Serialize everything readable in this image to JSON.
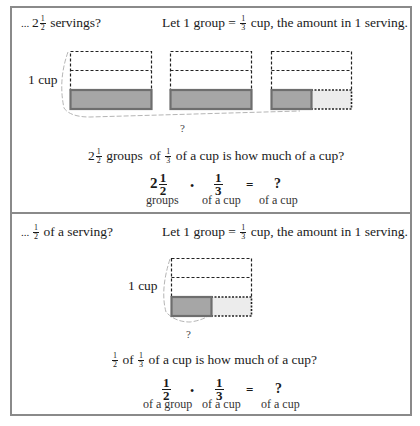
{
  "panel_top": {
    "heading": {
      "prefix": "... ",
      "whole": "2",
      "num": "1",
      "den": "2",
      "suffix": " servings?"
    },
    "definition": {
      "pre": "Let 1 group = ",
      "num": "1",
      "den": "3",
      "post": " cup, the amount in 1 serving."
    },
    "cup_label": "1 cup",
    "brace_label": "?",
    "question": {
      "whole": "2",
      "num": "1",
      "den": "2",
      "mid": " groups  of ",
      "num2": "1",
      "den2": "3",
      "post": " of a cup is how much of a cup?"
    },
    "equation": {
      "term1": {
        "whole": "2",
        "num": "1",
        "den": "2",
        "label": "groups"
      },
      "operator": "•",
      "term2": {
        "num": "1",
        "den": "3",
        "label": "of a cup"
      },
      "equals": "=",
      "result": {
        "value": "?",
        "label": "of a cup"
      }
    },
    "groups": [
      {
        "shaded_fraction": 1
      },
      {
        "shaded_fraction": 1
      },
      {
        "shaded_fraction": 0.5
      }
    ]
  },
  "panel_bottom": {
    "heading": {
      "prefix": "... ",
      "num": "1",
      "den": "2",
      "suffix": " of a serving?"
    },
    "definition": {
      "pre": "Let 1 group = ",
      "num": "1",
      "den": "3",
      "post": " cup, the amount in 1 serving."
    },
    "cup_label": "1 cup",
    "brace_label": "?",
    "question": {
      "num": "1",
      "den": "2",
      "mid": " of ",
      "num2": "1",
      "den2": "3",
      "post": " of a cup is how much of a cup?"
    },
    "equation": {
      "term1": {
        "num": "1",
        "den": "2",
        "label": "of a group"
      },
      "operator": "•",
      "term2": {
        "num": "1",
        "den": "3",
        "label": "of a cup"
      },
      "equals": "=",
      "result": {
        "value": "?",
        "label": "of a cup"
      }
    },
    "groups": [
      {
        "shaded_fraction": 0.5
      }
    ]
  },
  "colors": {
    "border": "#8a8a8a",
    "shaded_fill": "#a6a6a6",
    "shaded_stroke": "#6e6e6e",
    "light_fill": "#ececec",
    "dash": "#222222",
    "brace": "#b5b5b5"
  }
}
